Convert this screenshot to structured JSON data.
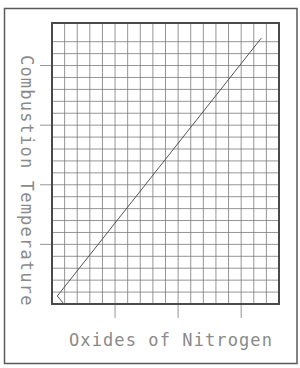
{
  "chart_data": {
    "type": "line",
    "title": "",
    "xlabel": "Oxides of Nitrogen",
    "ylabel": "Combustion Temperature",
    "x_tick_labels": [],
    "y_tick_labels": [],
    "grid": true,
    "grid_columns": 18,
    "grid_rows": 23,
    "legend": null,
    "units": "grid cells (no numeric axis labels shown)",
    "xlim": [
      0,
      18
    ],
    "ylim": [
      0,
      23.5
    ],
    "series": [
      {
        "name": "Combustion Temperature vs Oxides of Nitrogen",
        "x": [
          0.95,
          0.42,
          16.6
        ],
        "y": [
          0.0,
          0.67,
          22.3
        ]
      }
    ],
    "x_major_ticks_every_cols": 5,
    "y_major_ticks_every_rows": 5,
    "trend": "increasing, approximately linear"
  },
  "colors": {
    "frame": "#5a5a5a",
    "grid_border": "#4a4a4a",
    "grid_line": "#7a7a7a",
    "data_line": "#555555",
    "label_text": "#8a8a8a"
  }
}
